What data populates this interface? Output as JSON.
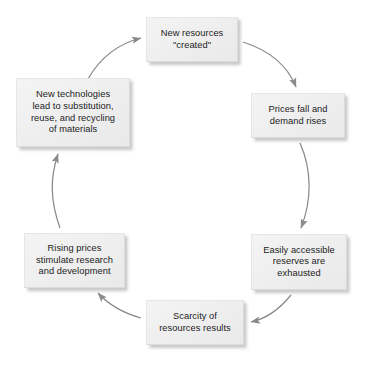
{
  "diagram": {
    "type": "cycle-flowchart",
    "direction": "clockwise",
    "background_color": "#ffffff",
    "node_fill_color": "#efefef",
    "node_border_color": "#dcdcdc",
    "text_color": "#1c1c1c",
    "arrow_color": "#7a7a7a",
    "nodes": [
      {
        "id": "created",
        "label": "New resources\n\"created\"",
        "position": "top"
      },
      {
        "id": "prices-fall",
        "label": "Prices fall and\ndemand rises",
        "position": "top-right"
      },
      {
        "id": "reserves",
        "label": "Easily accessible\nreserves are\nexhausted",
        "position": "bottom-right"
      },
      {
        "id": "scarcity",
        "label": "Scarcity of\nresources results",
        "position": "bottom"
      },
      {
        "id": "rising-prices",
        "label": "Rising prices\nstimulate research\nand development",
        "position": "bottom-left"
      },
      {
        "id": "technologies",
        "label": "New technologies\nlead to substitution,\nreuse, and recycling\nof materials",
        "position": "top-left"
      }
    ],
    "edges": [
      {
        "id": "created-to-prices",
        "from": "created",
        "to": "prices-fall",
        "style": "curved-arrow"
      },
      {
        "id": "prices-to-reserves",
        "from": "prices-fall",
        "to": "reserves",
        "style": "curved-arrow"
      },
      {
        "id": "reserves-to-scarcity",
        "from": "reserves",
        "to": "scarcity",
        "style": "curved-arrow"
      },
      {
        "id": "scarcity-to-rising",
        "from": "scarcity",
        "to": "rising-prices",
        "style": "curved-arrow"
      },
      {
        "id": "rising-to-technologies",
        "from": "rising-prices",
        "to": "technologies",
        "style": "curved-arrow"
      },
      {
        "id": "technologies-to-created",
        "from": "technologies",
        "to": "created",
        "style": "curved-arrow"
      }
    ]
  }
}
